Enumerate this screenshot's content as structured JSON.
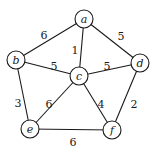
{
  "graph": {
    "type": "weighted-undirected",
    "nodes": [
      {
        "id": "a",
        "label": "a",
        "x": 84,
        "y": 19
      },
      {
        "id": "b",
        "label": "b",
        "x": 16,
        "y": 60
      },
      {
        "id": "c",
        "label": "c",
        "x": 79,
        "y": 76
      },
      {
        "id": "d",
        "label": "d",
        "x": 140,
        "y": 63
      },
      {
        "id": "e",
        "label": "e",
        "x": 30,
        "y": 129
      },
      {
        "id": "f",
        "label": "f",
        "x": 112,
        "y": 130
      }
    ],
    "edges": [
      {
        "from": "a",
        "to": "b",
        "weight": "6",
        "lx": 44,
        "ly": 35
      },
      {
        "from": "a",
        "to": "c",
        "weight": "1",
        "lx": 75,
        "ly": 50
      },
      {
        "from": "a",
        "to": "d",
        "weight": "5",
        "lx": 121,
        "ly": 36
      },
      {
        "from": "b",
        "to": "c",
        "weight": "5",
        "lx": 54,
        "ly": 66
      },
      {
        "from": "c",
        "to": "d",
        "weight": "5",
        "lx": 107,
        "ly": 66
      },
      {
        "from": "b",
        "to": "e",
        "weight": "3",
        "lx": 18,
        "ly": 103
      },
      {
        "from": "c",
        "to": "e",
        "weight": "6",
        "lx": 49,
        "ly": 104
      },
      {
        "from": "c",
        "to": "f",
        "weight": "4",
        "lx": 101,
        "ly": 104
      },
      {
        "from": "d",
        "to": "f",
        "weight": "2",
        "lx": 134,
        "ly": 104
      },
      {
        "from": "e",
        "to": "f",
        "weight": "6",
        "lx": 73,
        "ly": 142
      }
    ]
  }
}
